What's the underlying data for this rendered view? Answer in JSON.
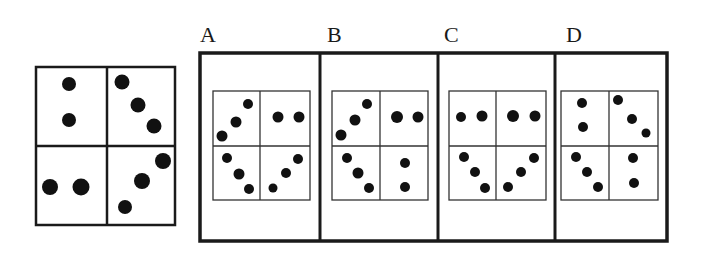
{
  "question_figure": {
    "quadrants": [
      {
        "position": "top-left",
        "dots": 2,
        "arrangement": "vertical"
      },
      {
        "position": "top-right",
        "dots": 3,
        "arrangement": "diagonal-down"
      },
      {
        "position": "bottom-left",
        "dots": 2,
        "arrangement": "horizontal"
      },
      {
        "position": "bottom-right",
        "dots": 3,
        "arrangement": "diagonal-up"
      }
    ]
  },
  "options": [
    {
      "label": "A",
      "quadrants": [
        {
          "position": "top-left",
          "dots": 3,
          "arrangement": "diagonal-up"
        },
        {
          "position": "top-right",
          "dots": 2,
          "arrangement": "horizontal"
        },
        {
          "position": "bottom-left",
          "dots": 3,
          "arrangement": "diagonal-down"
        },
        {
          "position": "bottom-right",
          "dots": 3,
          "arrangement": "diagonal-up"
        }
      ]
    },
    {
      "label": "B",
      "quadrants": [
        {
          "position": "top-left",
          "dots": 3,
          "arrangement": "diagonal-up"
        },
        {
          "position": "top-right",
          "dots": 2,
          "arrangement": "horizontal"
        },
        {
          "position": "bottom-left",
          "dots": 3,
          "arrangement": "diagonal-down"
        },
        {
          "position": "bottom-right",
          "dots": 2,
          "arrangement": "vertical"
        }
      ]
    },
    {
      "label": "C",
      "quadrants": [
        {
          "position": "top-left",
          "dots": 2,
          "arrangement": "horizontal"
        },
        {
          "position": "top-right",
          "dots": 2,
          "arrangement": "horizontal"
        },
        {
          "position": "bottom-left",
          "dots": 3,
          "arrangement": "diagonal-down"
        },
        {
          "position": "bottom-right",
          "dots": 3,
          "arrangement": "diagonal-up"
        }
      ]
    },
    {
      "label": "D",
      "quadrants": [
        {
          "position": "top-left",
          "dots": 2,
          "arrangement": "vertical"
        },
        {
          "position": "top-right",
          "dots": 3,
          "arrangement": "diagonal-down"
        },
        {
          "position": "bottom-left",
          "dots": 3,
          "arrangement": "diagonal-down"
        },
        {
          "position": "bottom-right",
          "dots": 2,
          "arrangement": "vertical"
        }
      ]
    }
  ]
}
